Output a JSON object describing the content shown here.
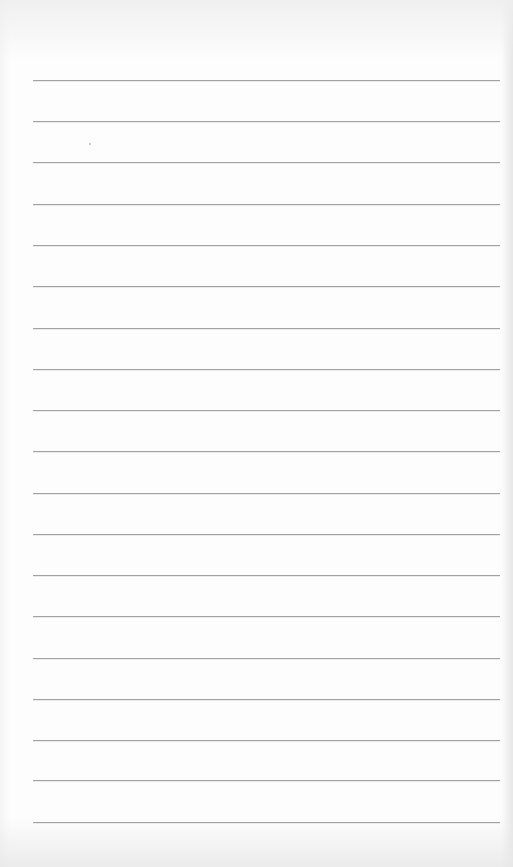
{
  "document": {
    "type": "ruled-notepaper",
    "content": "",
    "line_count": 19,
    "line_color": "#a2a2a2",
    "paper_color": "#fdfdfd",
    "lines_y": [
      80,
      121,
      162,
      204,
      245,
      286,
      328,
      369,
      410,
      451,
      493,
      534,
      575,
      616,
      658,
      699,
      740,
      780,
      822
    ]
  }
}
